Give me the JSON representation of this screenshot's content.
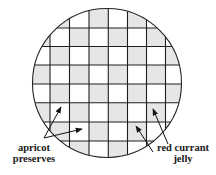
{
  "diagram": {
    "circle": {
      "cx": 107,
      "cy": 83,
      "r": 74.5,
      "stroke": "#222222"
    },
    "grid": {
      "vertical_lines": [
        50,
        69.5,
        89,
        108.3,
        127.5,
        146.5,
        165.5
      ],
      "horizontal_lines": [
        28,
        46.5,
        65,
        84,
        102.8,
        122,
        141
      ],
      "line_color": "#1e1e1e",
      "shade_rule": "cell shaded when (row + col) is odd",
      "col_edges": [
        30,
        50,
        69.5,
        89,
        108.3,
        127.5,
        146.5,
        165.5,
        184
      ],
      "row_edges": [
        7,
        28,
        46.5,
        65,
        84,
        102.8,
        122,
        141,
        160
      ]
    },
    "colors": {
      "shaded_cell": "#e6e6e6",
      "plain_cell": "#ffffff",
      "arrow": "#111111"
    },
    "labels": {
      "left": {
        "line1": "apricot",
        "line2": "preserves"
      },
      "right": {
        "line1": "red currant",
        "line2": "jelly"
      }
    },
    "arrows": [
      {
        "name": "arrow-apricot-upper",
        "from": [
          44,
          138
        ],
        "to": [
          61,
          107
        ]
      },
      {
        "name": "arrow-apricot-lower",
        "from": [
          44,
          138
        ],
        "to": [
          82,
          129
        ]
      },
      {
        "name": "arrow-currant-lower",
        "from": [
          153,
          152
        ],
        "to": [
          136,
          126
        ]
      },
      {
        "name": "arrow-currant-upper",
        "from": [
          168,
          144
        ],
        "to": [
          153,
          109
        ]
      }
    ]
  }
}
